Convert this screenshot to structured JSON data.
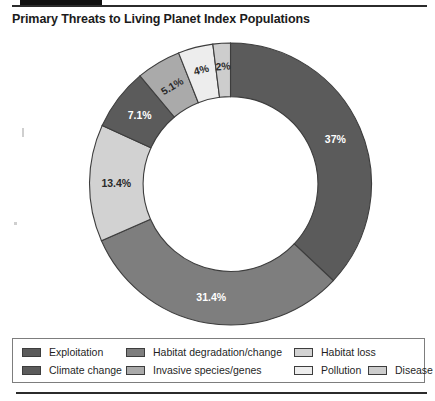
{
  "title": "Primary Threats to Living Planet Index Populations",
  "colors": {
    "exploitation": "#5b5b5b",
    "habitat_degradation": "#7e7e7e",
    "habitat_loss": "#d2d2d2",
    "climate_change": "#5b5b5b",
    "invasive_species": "#aaaaaa",
    "pollution": "#ededed",
    "disease": "#cdcdcd",
    "segment_outline": "#3d3d3d",
    "label_on_dark": "#ffffff",
    "label_on_light": "#2a2a2a",
    "legend_border": "#7d7d7d",
    "rule": "#2b2b2b",
    "top_bar": "#111111"
  },
  "legend": {
    "items": [
      {
        "label": "Exploitation",
        "color": "#5b5b5b"
      },
      {
        "label": "Habitat degradation/change",
        "color": "#7e7e7e"
      },
      {
        "label": "Habitat loss",
        "color": "#d2d2d2"
      },
      {
        "label": "Climate change",
        "color": "#5b5b5b"
      },
      {
        "label": "Invasive species/genes",
        "color": "#aaaaaa"
      },
      {
        "label": "Pollution",
        "color": "#ededed"
      },
      {
        "label": "Disease",
        "color": "#cdcdcd"
      }
    ]
  },
  "chart_data": {
    "type": "pie",
    "variant": "donut",
    "title": "Primary Threats to Living Planet Index Populations",
    "unit": "percent",
    "start_angle_deg": 0,
    "direction": "clockwise",
    "inner_radius_ratio": 0.62,
    "legend_position": "bottom",
    "grid": false,
    "labels": [
      "Exploitation",
      "Habitat degradation/change",
      "Habitat loss",
      "Climate change",
      "Invasive species/genes",
      "Pollution",
      "Disease"
    ],
    "values": [
      37,
      31.4,
      13.4,
      7.1,
      5.1,
      4,
      2
    ],
    "value_labels": [
      "37%",
      "31.4%",
      "13.4%",
      "7.1%",
      "5.1%",
      "4%",
      "2%"
    ],
    "slices": [
      {
        "label": "Exploitation",
        "value": 37,
        "value_label": "37%",
        "color": "#5b5b5b",
        "label_color": "on-dark"
      },
      {
        "label": "Habitat degradation/change",
        "value": 31.4,
        "value_label": "31.4%",
        "color": "#7e7e7e",
        "label_color": "on-dark"
      },
      {
        "label": "Habitat loss",
        "value": 13.4,
        "value_label": "13.4%",
        "color": "#d2d2d2",
        "label_color": "on-light"
      },
      {
        "label": "Climate change",
        "value": 7.1,
        "value_label": "7.1%",
        "color": "#5b5b5b",
        "label_color": "on-dark"
      },
      {
        "label": "Invasive species/genes",
        "value": 5.1,
        "value_label": "5.1%",
        "color": "#aaaaaa",
        "label_color": "on-light"
      },
      {
        "label": "Pollution",
        "value": 4,
        "value_label": "4%",
        "color": "#ededed",
        "label_color": "on-light"
      },
      {
        "label": "Disease",
        "value": 2,
        "value_label": "2%",
        "color": "#cdcdcd",
        "label_color": "on-light"
      }
    ],
    "total": 100
  }
}
